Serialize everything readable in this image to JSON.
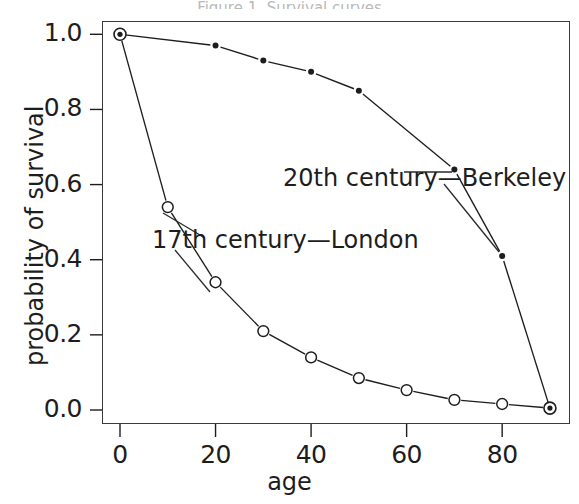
{
  "figure": {
    "title_sliver": "Figure 1.  Survival curves",
    "background": "#ffffff",
    "ink_color": "#1d1d1d"
  },
  "axes": {
    "xlabel": "age",
    "ylabel": "probability of survival",
    "xticks": [
      0,
      20,
      40,
      60,
      80
    ],
    "xtick_labels": [
      "0",
      "20",
      "40",
      "60",
      "80"
    ],
    "yticks": [
      0.0,
      0.2,
      0.4,
      0.6,
      0.8,
      1.0
    ],
    "ytick_labels": [
      "0.0",
      "0.2",
      "0.4",
      "0.6",
      "0.8",
      "1.0"
    ],
    "xlim": [
      -4,
      94
    ],
    "ylim": [
      -0.04,
      1.045
    ],
    "frame": true,
    "grid": false
  },
  "annotations": {
    "london": "17th century—London",
    "berkeley": "20th century—Berkeley"
  },
  "chart_data": {
    "type": "line",
    "title": "",
    "xlabel": "age",
    "ylabel": "probability of survival",
    "xlim": [
      -4,
      94
    ],
    "ylim": [
      -0.04,
      1.045
    ],
    "grid": false,
    "legend_position": "inline-annotations",
    "series": [
      {
        "name": "20th century—Berkeley",
        "marker": "filled-circle",
        "linestyle": "dashed",
        "x": [
          0,
          20,
          30,
          40,
          50,
          70,
          80,
          90
        ],
        "y": [
          1.0,
          0.97,
          0.93,
          0.9,
          0.85,
          0.64,
          0.41,
          0.005
        ]
      },
      {
        "name": "17th century—London",
        "marker": "open-circle",
        "linestyle": "dashed",
        "x": [
          0,
          10,
          20,
          30,
          40,
          50,
          60,
          70,
          80,
          90
        ],
        "y": [
          1.0,
          0.54,
          0.34,
          0.21,
          0.14,
          0.085,
          0.053,
          0.027,
          0.016,
          0.005
        ]
      }
    ],
    "shared_endpoints": [
      {
        "x": 0,
        "y": 1.0,
        "marker": "bullseye"
      },
      {
        "x": 90,
        "y": 0.005,
        "marker": "bullseye"
      }
    ]
  }
}
